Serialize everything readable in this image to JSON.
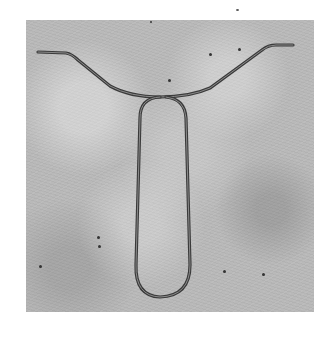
{
  "image": {
    "description": "Grayscale photograph of a bent metal wire shaped like a wishbone/tie on a textured gray surface",
    "colors": {
      "page_background": "#ffffff",
      "surface": "#b9b9b9",
      "wire_dark": "#3a3a3a",
      "wire_light": "#8a8a8a"
    }
  }
}
